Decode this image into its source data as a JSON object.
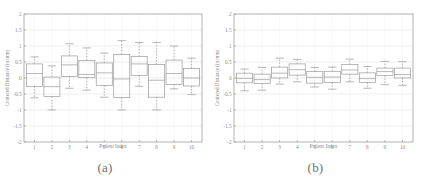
{
  "figure": {
    "panels": [
      {
        "caption": "(a)",
        "xlabel": "Patient Index",
        "ylabel": "Centered Distance (in mm)"
      },
      {
        "caption": "(b)",
        "xlabel": "Patient Index",
        "ylabel": "Centered Distance (in mm)"
      }
    ]
  },
  "chart_data": [
    {
      "type": "box",
      "panel": "(a)",
      "title": "",
      "xlabel": "Patient Index",
      "ylabel": "Centered Distance (in mm)",
      "ylim": [
        -2,
        2
      ],
      "yticks": [
        -2,
        -1.5,
        -1,
        -0.5,
        0,
        0.5,
        1,
        1.5,
        2
      ],
      "ytick_labels": [
        "-2",
        "-1.5",
        "-1",
        "-0.5",
        "0",
        "0.5",
        "1",
        "1.5",
        "2"
      ],
      "xlim": [
        0.4,
        10.6
      ],
      "categories": [
        "1",
        "2",
        "3",
        "4",
        "5",
        "6",
        "7",
        "8",
        "9",
        "10"
      ],
      "grid": true,
      "legend": "none",
      "boxes": [
        {
          "x": 1,
          "whisker_low": -0.62,
          "q1": -0.26,
          "median": 0.14,
          "q3": 0.44,
          "whisker_high": 0.66
        },
        {
          "x": 2,
          "whisker_low": -1.0,
          "q1": -0.58,
          "median": -0.27,
          "q3": 0.03,
          "whisker_high": 0.38
        },
        {
          "x": 3,
          "whisker_low": -0.32,
          "q1": 0.05,
          "median": 0.41,
          "q3": 0.69,
          "whisker_high": 1.07
        },
        {
          "x": 4,
          "whisker_low": -0.38,
          "q1": 0.01,
          "median": 0.11,
          "q3": 0.55,
          "whisker_high": 0.94
        },
        {
          "x": 5,
          "whisker_low": -0.6,
          "q1": -0.23,
          "median": 0.16,
          "q3": 0.47,
          "whisker_high": 0.78
        },
        {
          "x": 6,
          "whisker_low": -1.0,
          "q1": -0.61,
          "median": -0.03,
          "q3": 0.73,
          "whisker_high": 1.17
        },
        {
          "x": 7,
          "whisker_low": -0.26,
          "q1": 0.08,
          "median": 0.44,
          "q3": 0.67,
          "whisker_high": 1.11
        },
        {
          "x": 8,
          "whisker_low": -1.0,
          "q1": -0.6,
          "median": -0.07,
          "q3": 0.42,
          "whisker_high": 1.11
        },
        {
          "x": 9,
          "whisker_low": -0.34,
          "q1": -0.2,
          "median": 0.14,
          "q3": 0.56,
          "whisker_high": 1.0
        },
        {
          "x": 10,
          "whisker_low": -0.52,
          "q1": -0.25,
          "median": 0.0,
          "q3": 0.3,
          "whisker_high": 0.62
        }
      ]
    },
    {
      "type": "box",
      "panel": "(b)",
      "title": "",
      "xlabel": "Patient Index",
      "ylabel": "Centered Distance (in mm)",
      "ylim": [
        -2,
        2
      ],
      "yticks": [
        -2,
        -1.5,
        -1,
        -0.5,
        0,
        0.5,
        1,
        1.5,
        2
      ],
      "ytick_labels": [
        "-2",
        "-1.5",
        "-1",
        "-0.5",
        "0",
        "0.5",
        "1",
        "1.5",
        "2"
      ],
      "xlim": [
        0.4,
        10.6
      ],
      "categories": [
        "1",
        "2",
        "3",
        "4",
        "5",
        "6",
        "7",
        "8",
        "9",
        "10"
      ],
      "grid": true,
      "legend": "none",
      "boxes": [
        {
          "x": 1,
          "whisker_low": -0.4,
          "q1": -0.15,
          "median": -0.01,
          "q3": 0.15,
          "whisker_high": 0.28
        },
        {
          "x": 2,
          "whisker_low": -0.38,
          "q1": -0.17,
          "median": -0.05,
          "q3": 0.12,
          "whisker_high": 0.33
        },
        {
          "x": 3,
          "whisker_low": -0.19,
          "q1": 0.0,
          "median": 0.15,
          "q3": 0.34,
          "whisker_high": 0.62
        },
        {
          "x": 4,
          "whisker_low": -0.12,
          "q1": 0.09,
          "median": 0.26,
          "q3": 0.44,
          "whisker_high": 0.58
        },
        {
          "x": 5,
          "whisker_low": -0.28,
          "q1": -0.16,
          "median": 0.02,
          "q3": 0.2,
          "whisker_high": 0.33
        },
        {
          "x": 6,
          "whisker_low": -0.35,
          "q1": -0.14,
          "median": 0.03,
          "q3": 0.21,
          "whisker_high": 0.34
        },
        {
          "x": 7,
          "whisker_low": -0.12,
          "q1": 0.12,
          "median": 0.25,
          "q3": 0.42,
          "whisker_high": 0.59
        },
        {
          "x": 8,
          "whisker_low": -0.32,
          "q1": -0.14,
          "median": -0.02,
          "q3": 0.16,
          "whisker_high": 0.36
        },
        {
          "x": 9,
          "whisker_low": -0.21,
          "q1": 0.08,
          "median": 0.2,
          "q3": 0.31,
          "whisker_high": 0.52
        },
        {
          "x": 10,
          "whisker_low": -0.23,
          "q1": 0.0,
          "median": 0.11,
          "q3": 0.31,
          "whisker_high": 0.51
        }
      ]
    }
  ],
  "style": {
    "line_color": "#9a9a9a",
    "frame_color": "#9e9e9e",
    "grid_color": "#e2e2e2",
    "text_color": "#8a8a8a",
    "caption_color": "#6f6f6f",
    "background": "#ffffff"
  }
}
